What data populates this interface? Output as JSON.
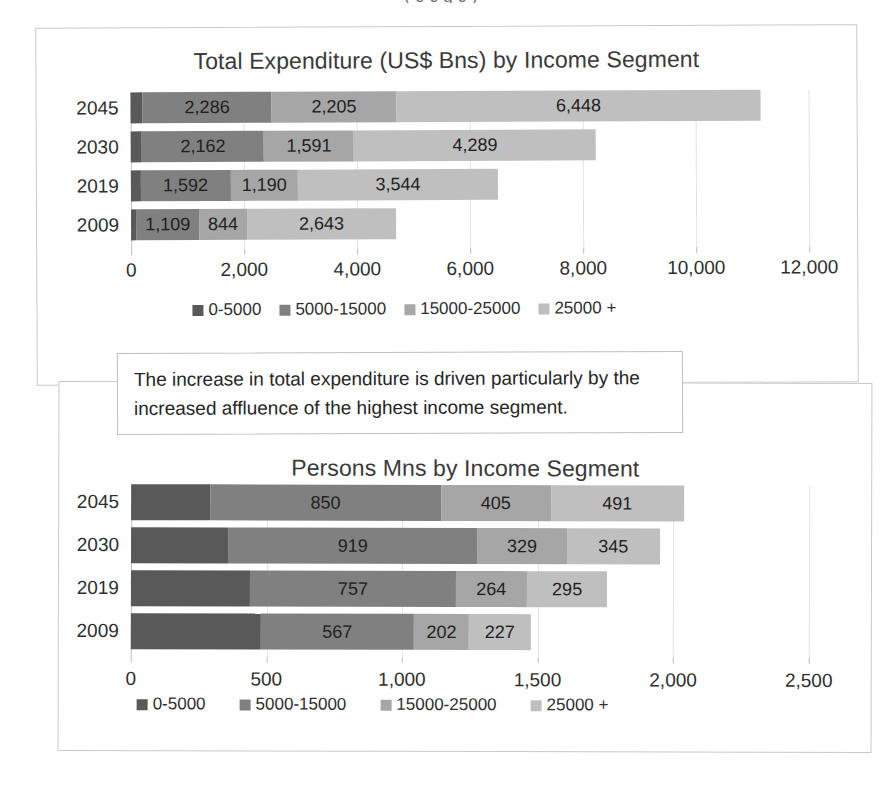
{
  "page": {
    "top_caption_fragment": "( 0 0 g 0 )"
  },
  "callout": {
    "text": "The increase in total expenditure is driven particularly by the increased affluence of the highest income segment."
  },
  "palette": {
    "s0_5000": "#595959",
    "s5000_15000": "#808080",
    "s15000_25000": "#a6a6a6",
    "s25000_plus": "#bfbfbf",
    "gridline": "#e3e3e3",
    "axis": "#c2c2c2",
    "frame_border": "#c9c9c9",
    "text": "#2f2f2f"
  },
  "legend_labels": [
    "0-5000",
    "5000-15000",
    "15000-25000",
    "25000 +"
  ],
  "chart_data": [
    {
      "id": "expenditure",
      "type": "bar",
      "orientation": "horizontal",
      "stacked": true,
      "title": "Total Expenditure (US$ Bns) by Income Segment",
      "xlabel": "",
      "ylabel": "",
      "xlim": [
        0,
        12000
      ],
      "xticks": [
        0,
        2000,
        4000,
        6000,
        8000,
        10000,
        12000
      ],
      "xticklabels": [
        "0",
        "2,000",
        "4,000",
        "6,000",
        "8,000",
        "10,000",
        "12,000"
      ],
      "grid": true,
      "legend_position": "bottom",
      "categories": [
        "2045",
        "2030",
        "2019",
        "2009"
      ],
      "series": [
        {
          "name": "0-5000",
          "values": [
            212,
            196,
            172,
            95
          ],
          "labels": [
            "",
            "",
            "",
            ""
          ]
        },
        {
          "name": "5000-15000",
          "values": [
            2286,
            2162,
            1592,
            1109
          ],
          "labels": [
            "2,286",
            "2,162",
            "1,592",
            "1,109"
          ]
        },
        {
          "name": "15000-25000",
          "values": [
            2205,
            1591,
            1190,
            844
          ],
          "labels": [
            "2,205",
            "1,591",
            "1,190",
            "844"
          ]
        },
        {
          "name": "25000 +",
          "values": [
            6448,
            4289,
            3544,
            2643
          ],
          "labels": [
            "6,448",
            "4,289",
            "3,544",
            "2,643"
          ]
        }
      ]
    },
    {
      "id": "persons",
      "type": "bar",
      "orientation": "horizontal",
      "stacked": true,
      "title": "Persons Mns by Income Segment",
      "xlabel": "",
      "ylabel": "",
      "xlim": [
        0,
        2500
      ],
      "xticks": [
        0,
        500,
        1000,
        1500,
        2000,
        2500
      ],
      "xticklabels": [
        "0",
        "500",
        "1,000",
        "1,500",
        "2,000",
        "2,500"
      ],
      "grid": true,
      "legend_position": "bottom",
      "categories": [
        "2045",
        "2030",
        "2019",
        "2009"
      ],
      "series": [
        {
          "name": "0-5000",
          "values": [
            292,
            358,
            440,
            478
          ],
          "labels": [
            "",
            "",
            "",
            ""
          ]
        },
        {
          "name": "5000-15000",
          "values": [
            850,
            919,
            757,
            567
          ],
          "labels": [
            "850",
            "919",
            "757",
            "567"
          ]
        },
        {
          "name": "15000-25000",
          "values": [
            405,
            329,
            264,
            202
          ],
          "labels": [
            "405",
            "329",
            "264",
            "202"
          ]
        },
        {
          "name": "25000 +",
          "values": [
            491,
            345,
            295,
            227
          ],
          "labels": [
            "491",
            "345",
            "295",
            "227"
          ]
        }
      ]
    }
  ]
}
